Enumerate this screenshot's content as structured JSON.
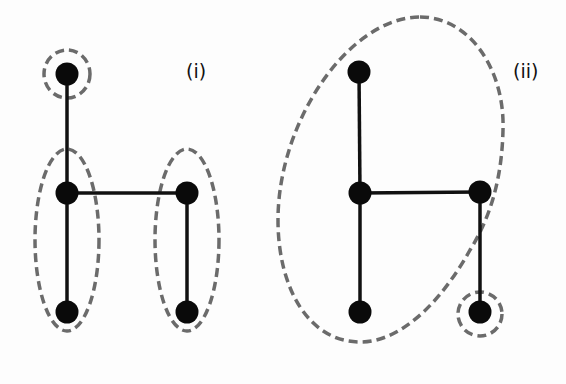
{
  "colors": {
    "node": "#0a0a0a",
    "edge": "#111111",
    "dashed_outline": "#6b6b6b",
    "background": "#fdfdfd"
  },
  "panels": [
    {
      "label": "(i)",
      "label_pos": [
        186,
        62
      ],
      "nodes": [
        {
          "id": "top",
          "x": 67,
          "y": 74
        },
        {
          "id": "mid-left",
          "x": 67,
          "y": 193
        },
        {
          "id": "mid-right",
          "x": 187,
          "y": 193
        },
        {
          "id": "bottom-left",
          "x": 67,
          "y": 312
        },
        {
          "id": "bottom-right",
          "x": 187,
          "y": 312
        }
      ],
      "edges": [
        [
          "top",
          "mid-left"
        ],
        [
          "mid-left",
          "mid-right"
        ],
        [
          "mid-left",
          "bottom-left"
        ],
        [
          "mid-right",
          "bottom-right"
        ]
      ],
      "groups": [
        {
          "name": "circle-top",
          "type": "ellipse",
          "cx": 67,
          "cy": 74,
          "rx": 23,
          "ry": 24
        },
        {
          "name": "ellipse-left",
          "type": "ellipse",
          "cx": 67,
          "cy": 240,
          "rx": 32,
          "ry": 91
        },
        {
          "name": "ellipse-right",
          "type": "ellipse",
          "cx": 187,
          "cy": 240,
          "rx": 32,
          "ry": 91
        }
      ]
    },
    {
      "label": "(ii)",
      "label_pos": [
        513,
        62
      ],
      "nodes": [
        {
          "id": "top",
          "x": 359,
          "y": 72
        },
        {
          "id": "mid-left",
          "x": 360,
          "y": 193
        },
        {
          "id": "mid-right",
          "x": 480,
          "y": 192
        },
        {
          "id": "bottom-left",
          "x": 360,
          "y": 312
        },
        {
          "id": "bottom-right",
          "x": 480,
          "y": 312
        }
      ],
      "edges": [
        [
          "top",
          "mid-left"
        ],
        [
          "mid-left",
          "mid-right"
        ],
        [
          "mid-left",
          "bottom-left"
        ],
        [
          "mid-right",
          "bottom-right"
        ]
      ],
      "groups": [
        {
          "name": "blob-large",
          "type": "path",
          "d": "M 420 17 C 470 17, 505 70, 503 130 C 502 175, 492 215, 470 250 C 445 295, 405 342, 360 342 C 310 342, 278 290, 278 220 C 278 120, 350 17, 420 17 Z"
        },
        {
          "name": "circle-bottom-right",
          "type": "ellipse",
          "cx": 480,
          "cy": 314,
          "rx": 22,
          "ry": 22
        }
      ]
    }
  ]
}
